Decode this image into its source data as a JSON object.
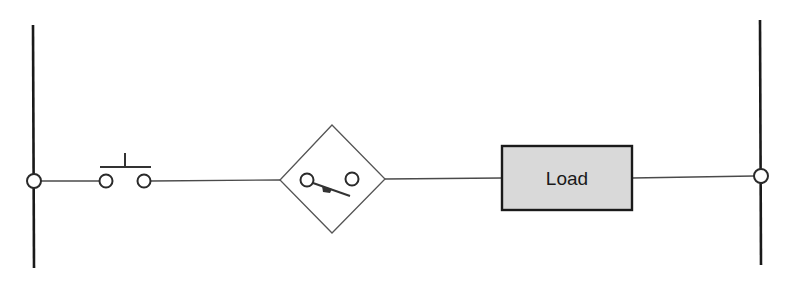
{
  "diagram": {
    "type": "ladder-circuit",
    "rails": [
      {
        "id": "left-rail",
        "x": 33,
        "y1": 25,
        "y2": 268
      },
      {
        "id": "right-rail",
        "x": 760,
        "y1": 20,
        "y2": 265
      }
    ],
    "components": [
      {
        "id": "pushbutton",
        "kind": "normally-open pushbutton switch"
      },
      {
        "id": "sensor-switch",
        "kind": "switch inside diamond (sensor/proximity switch)"
      },
      {
        "id": "load",
        "kind": "load",
        "label": "Load"
      }
    ],
    "colors": {
      "line": "#1a1a1a",
      "wire": "#4a4a4a",
      "load_fill": "#d9d9d9",
      "background": "#ffffff"
    }
  },
  "load": {
    "label": "Load"
  }
}
